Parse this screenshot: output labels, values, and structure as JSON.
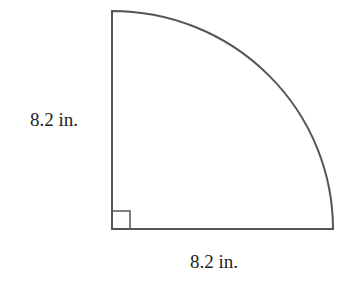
{
  "figure": {
    "shape": "quarter-circle",
    "colors": {
      "stroke": "#555555",
      "background": "#ffffff",
      "text": "#222222"
    },
    "labels": {
      "vertical_radius": "8.2 in.",
      "horizontal_radius": "8.2 in."
    },
    "right_angle_marker": true
  }
}
